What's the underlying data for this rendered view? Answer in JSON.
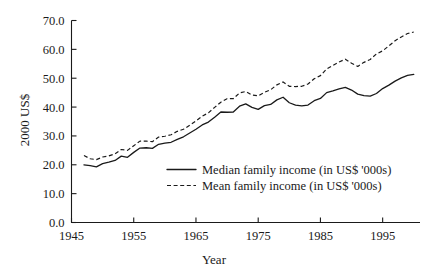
{
  "chart_data": {
    "type": "line",
    "title": "",
    "subtitle": "",
    "xlabel": "Year",
    "ylabel": "2000 US$",
    "xlim": [
      1945,
      2001
    ],
    "ylim": [
      0.0,
      70.0
    ],
    "grid": false,
    "legend_position": "center",
    "x_ticks": [
      "1945",
      "1955",
      "1965",
      "1975",
      "1985",
      "1995"
    ],
    "x_tick_values": [
      1945,
      1955,
      1965,
      1975,
      1985,
      1995
    ],
    "y_ticks": [
      "0.0",
      "10.0",
      "20.0",
      "30.0",
      "40.0",
      "50.0",
      "60.0",
      "70.0"
    ],
    "y_tick_values": [
      0.0,
      10.0,
      20.0,
      30.0,
      40.0,
      50.0,
      60.0,
      70.0
    ],
    "x": [
      1947,
      1948,
      1949,
      1950,
      1951,
      1952,
      1953,
      1954,
      1955,
      1956,
      1957,
      1958,
      1959,
      1960,
      1961,
      1962,
      1963,
      1964,
      1965,
      1966,
      1967,
      1968,
      1969,
      1970,
      1971,
      1972,
      1973,
      1974,
      1975,
      1976,
      1977,
      1978,
      1979,
      1980,
      1981,
      1982,
      1983,
      1984,
      1985,
      1986,
      1987,
      1988,
      1989,
      1990,
      1991,
      1992,
      1993,
      1994,
      1995,
      1996,
      1997,
      1998,
      1999,
      2000
    ],
    "series": [
      {
        "name": "Median family income (in US$ '000s)",
        "style": "solid",
        "values": [
          20.0,
          19.7,
          19.3,
          20.4,
          20.9,
          21.5,
          23.0,
          22.6,
          24.3,
          25.8,
          25.9,
          25.7,
          27.1,
          27.5,
          27.8,
          28.8,
          29.7,
          31.0,
          32.3,
          33.8,
          34.8,
          36.5,
          38.3,
          38.2,
          38.3,
          40.3,
          41.1,
          39.9,
          39.2,
          40.5,
          40.9,
          42.5,
          43.4,
          41.5,
          40.7,
          40.4,
          40.7,
          42.2,
          43.0,
          45.0,
          45.6,
          46.3,
          46.8,
          45.9,
          44.5,
          44.0,
          43.8,
          44.7,
          46.4,
          47.6,
          49.0,
          50.1,
          51.0,
          51.3
        ]
      },
      {
        "name": "Mean family income (in US$ '000s)",
        "style": "dashed",
        "values": [
          23.2,
          22.1,
          21.8,
          22.7,
          23.1,
          23.8,
          25.3,
          25.0,
          26.6,
          28.2,
          28.2,
          28.0,
          29.6,
          29.9,
          30.4,
          31.6,
          32.3,
          33.7,
          35.2,
          36.8,
          38.0,
          39.9,
          41.7,
          42.9,
          42.9,
          44.9,
          45.4,
          44.2,
          43.9,
          45.1,
          46.0,
          47.7,
          48.7,
          47.2,
          47.1,
          47.2,
          48.0,
          49.8,
          50.9,
          53.2,
          54.4,
          55.6,
          56.6,
          55.2,
          54.1,
          55.5,
          56.5,
          58.4,
          59.5,
          61.2,
          63.0,
          64.3,
          65.5,
          66.0
        ]
      }
    ]
  },
  "legend": {
    "entries": [
      {
        "label": "Median family income (in US$ '000s)",
        "style": "solid"
      },
      {
        "label": "Mean family income (in US$ '000s)",
        "style": "dashed"
      }
    ]
  }
}
